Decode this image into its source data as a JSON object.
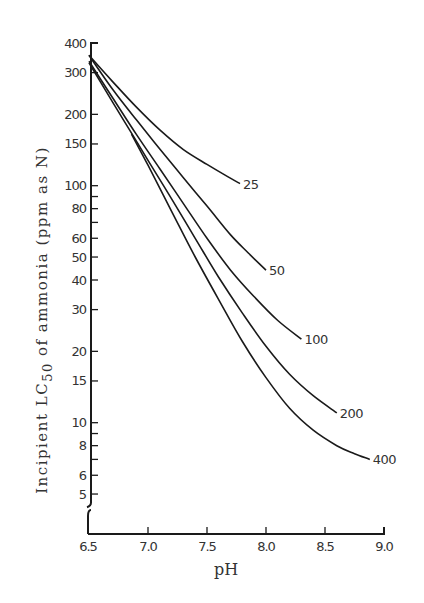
{
  "chart_data": {
    "type": "line",
    "title": "",
    "xlabel": "pH",
    "ylabel_parts": {
      "pre": "Incipient LC",
      "sub": "50",
      "post": " of ammonia (ppm as N)"
    },
    "ylabel": "Incipient LC50 of ammonia (ppm as N)",
    "xlim": [
      6.5,
      9.0
    ],
    "ylim": [
      4,
      400
    ],
    "yscale": "log",
    "grid": false,
    "legend": "inline labels at curve ends",
    "x_ticks": [
      "6.5",
      "7.0",
      "7.5",
      "8.0",
      "8.5",
      "9.0"
    ],
    "x_tick_values": [
      6.5,
      7.0,
      7.5,
      8.0,
      8.5,
      9.0
    ],
    "y_ticks_labeled": [
      {
        "v": 400,
        "label": "400"
      },
      {
        "v": 300,
        "label": "300"
      },
      {
        "v": 200,
        "label": "200"
      },
      {
        "v": 150,
        "label": "150"
      },
      {
        "v": 100,
        "label": "100"
      },
      {
        "v": 80,
        "label": "80"
      },
      {
        "v": 60,
        "label": "60"
      },
      {
        "v": 50,
        "label": "50"
      },
      {
        "v": 40,
        "label": "40"
      },
      {
        "v": 30,
        "label": "30"
      },
      {
        "v": 20,
        "label": "20"
      },
      {
        "v": 15,
        "label": "15"
      },
      {
        "v": 10,
        "label": "10"
      },
      {
        "v": 8,
        "label": "8"
      },
      {
        "v": 6,
        "label": "6"
      },
      {
        "v": 5,
        "label": "5"
      }
    ],
    "y_ticks_minor": [
      90,
      70,
      9,
      7
    ],
    "series": [
      {
        "name": "25",
        "points": [
          [
            6.5,
            355
          ],
          [
            6.7,
            275
          ],
          [
            6.9,
            215
          ],
          [
            7.1,
            172
          ],
          [
            7.3,
            142
          ],
          [
            7.5,
            123
          ],
          [
            7.65,
            111
          ],
          [
            7.78,
            102
          ]
        ]
      },
      {
        "name": "50",
        "points": [
          [
            6.5,
            355
          ],
          [
            6.7,
            255
          ],
          [
            6.9,
            190
          ],
          [
            7.1,
            143
          ],
          [
            7.3,
            108
          ],
          [
            7.5,
            82
          ],
          [
            7.7,
            62
          ],
          [
            7.85,
            52
          ],
          [
            8.0,
            44
          ]
        ]
      },
      {
        "name": "100",
        "points": [
          [
            6.5,
            335
          ],
          [
            6.7,
            235
          ],
          [
            6.9,
            165
          ],
          [
            7.1,
            118
          ],
          [
            7.3,
            84
          ],
          [
            7.5,
            60
          ],
          [
            7.7,
            44
          ],
          [
            7.9,
            34
          ],
          [
            8.1,
            27
          ],
          [
            8.3,
            22.5
          ]
        ]
      },
      {
        "name": "200",
        "points": [
          [
            6.5,
            330
          ],
          [
            6.7,
            225
          ],
          [
            6.85,
            170
          ],
          [
            7.0,
            128
          ],
          [
            7.2,
            88
          ],
          [
            7.4,
            60
          ],
          [
            7.6,
            41
          ],
          [
            7.8,
            29
          ],
          [
            8.0,
            21
          ],
          [
            8.2,
            16
          ],
          [
            8.4,
            13
          ],
          [
            8.6,
            11
          ]
        ]
      },
      {
        "name": "400",
        "points": [
          [
            6.86,
            165
          ],
          [
            7.0,
            122
          ],
          [
            7.2,
            78
          ],
          [
            7.4,
            50
          ],
          [
            7.6,
            33
          ],
          [
            7.8,
            22
          ],
          [
            8.0,
            15.5
          ],
          [
            8.2,
            11.5
          ],
          [
            8.4,
            9.3
          ],
          [
            8.6,
            8
          ],
          [
            8.75,
            7.4
          ],
          [
            8.88,
            7
          ]
        ]
      }
    ],
    "series_extra": [
      {
        "name": "400-start-segment",
        "points": [
          [
            7.07,
            95
          ],
          [
            7.2,
            72
          ]
        ]
      }
    ]
  }
}
